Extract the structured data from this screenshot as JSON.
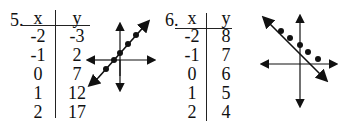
{
  "problems": [
    {
      "number": "5.",
      "table": {
        "headers": [
          "x",
          "y"
        ],
        "rows": [
          {
            "x": "-2",
            "y": "-3"
          },
          {
            "x": "-1",
            "y": "2"
          },
          {
            "x": "0",
            "y": "7"
          },
          {
            "x": "1",
            "y": "12"
          },
          {
            "x": "2",
            "y": "17"
          }
        ]
      },
      "graph": {
        "slope": "positive",
        "points": 5
      }
    },
    {
      "number": "6.",
      "table": {
        "headers": [
          "x",
          "y"
        ],
        "rows": [
          {
            "x": "-2",
            "y": "8"
          },
          {
            "x": "-1",
            "y": "7"
          },
          {
            "x": "0",
            "y": "6"
          },
          {
            "x": "1",
            "y": "5"
          },
          {
            "x": "2",
            "y": "4"
          }
        ]
      },
      "graph": {
        "slope": "negative",
        "points": 5
      }
    }
  ]
}
